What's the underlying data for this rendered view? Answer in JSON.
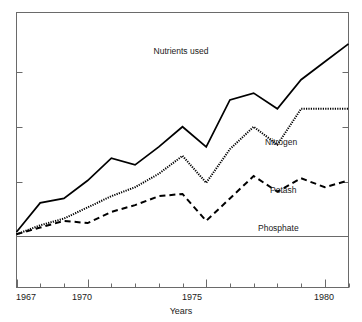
{
  "chart_data": {
    "type": "line",
    "title": "Nutrients used",
    "xlabel": "Years",
    "ylabel": "",
    "xlim": [
      1967,
      1981
    ],
    "ylim": [
      0,
      100
    ],
    "grid": false,
    "legend_position": "inline-right-of-series",
    "x": [
      1967,
      1968,
      1969,
      1970,
      1971,
      1972,
      1973,
      1974,
      1975,
      1976,
      1977,
      1978,
      1979,
      1980,
      1981
    ],
    "x_tick_values": [
      1967,
      1968,
      1969,
      1970,
      1971,
      1972,
      1973,
      1974,
      1975,
      1976,
      1977,
      1978,
      1979,
      1980,
      1981
    ],
    "x_tick_labels": [
      "1967",
      "",
      "",
      "1970",
      "",
      "",
      "",
      "",
      "1975",
      "",
      "",
      "",
      "",
      "1980",
      ""
    ],
    "y_tick_values": [
      25,
      50,
      75
    ],
    "y_tick_labels": [
      "",
      "",
      ""
    ],
    "series": [
      {
        "name": "Nitrogen",
        "style": "solid",
        "values": [
          2,
          15,
          17,
          25,
          35,
          32,
          40,
          49,
          40,
          61,
          64,
          57,
          70,
          78,
          86
        ]
      },
      {
        "name": "Potash",
        "style": "dotted",
        "values": [
          1,
          5,
          8,
          13,
          18,
          22,
          28,
          36,
          24,
          39,
          49,
          41,
          57,
          57,
          57
        ]
      },
      {
        "name": "Phosphate",
        "style": "dashed",
        "values": [
          1,
          4,
          7,
          6,
          11,
          14,
          18,
          19,
          7,
          17,
          27,
          20,
          26,
          22,
          25
        ]
      }
    ]
  },
  "annotations": {
    "nitrogen_label": "Nitrogen",
    "potash_label": "Potash",
    "phosphate_label": "Phosphate",
    "title_label": "Nutrients used",
    "xaxis_title": "Years",
    "first_year_label": "1967",
    "year_1970_label": "1970",
    "year_1975_label": "1975",
    "year_1980_label": "1980"
  },
  "colors": {
    "line": "#000000",
    "frame": "#6a6a6a",
    "text": "#1a1a1a",
    "background": "#ffffff"
  }
}
